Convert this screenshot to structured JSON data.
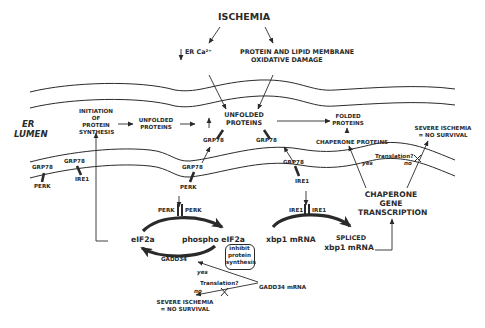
{
  "title": "ISCHEMIA",
  "inputs": {
    "er_calcium": "ER Ca²⁺",
    "er_calcium_direction": "decrease",
    "oxidative_damage_line1": "PROTEIN AND LIPID MEMBRANE",
    "oxidative_damage_line2": "OXIDATIVE DAMAGE"
  },
  "compartment": {
    "label_line1": "ER",
    "label_line2": "LUMEN"
  },
  "lumen": {
    "initiation_line1": "INITIATION",
    "initiation_line2": "OF",
    "initiation_line3": "PROTEIN",
    "initiation_line4": "SYNTHESIS",
    "unfolded_left_line1": "UNFOLDED",
    "unfolded_left_line2": "PROTEINS",
    "increase_symbol": "↑",
    "unfolded_center_line1": "UNFOLDED",
    "unfolded_center_line2": "PROTEINS",
    "grp78_left": "GRP78",
    "grp78_right": "GRP78",
    "folded_line1": "FOLDED",
    "folded_line2": "PROTEINS",
    "chaperone_proteins": "CHAPERONE PROTEINS",
    "severe_top_line1": "SEVERE ISCHEMIA",
    "severe_top_line2": "= NO SURVIVAL"
  },
  "membrane": {
    "resting_grp78_perk": "GRP78",
    "resting_perk": "PERK",
    "resting_grp78_ire1": "GRP78",
    "resting_ire1": "IRE1",
    "active_grp78_perk": "GRP78",
    "active_perk": "PERK",
    "active_grp78_ire1": "GRP78",
    "active_ire1": "IRE1",
    "translation_question": "Translation?",
    "yes": "yes",
    "no": "no"
  },
  "cytosol": {
    "perk_dimer_left": "PERK",
    "perk_dimer_right": "PERK",
    "eif2a": "eIF2a",
    "phospho_eif2a": "phospho eIF2a",
    "inhibit_line1": "inhibit",
    "inhibit_line2": "protein",
    "inhibit_line3": "synthesis",
    "gadd34": "GADD34",
    "gadd34_mrna": "GADD34 mRNA",
    "translation_question": "Translation?",
    "yes": "yes",
    "no": "no",
    "severe_bottom_line1": "SEVERE ISCHEMIA",
    "severe_bottom_line2": "= NO SURVIVAL",
    "ire1_dimer_left": "IRE1",
    "ire1_dimer_right": "IRE1",
    "xbp1_mrna": "xbp1 mRNA",
    "spliced_line1": "SPLICED",
    "spliced_line2": "xbp1 mRNA",
    "chaperone_gene_line1": "CHAPERONE",
    "chaperone_gene_line2": "GENE",
    "chaperone_gene_line3": "TRANSCRIPTION"
  },
  "colors": {
    "ink": "#2a2a2a",
    "background": "#ffffff"
  }
}
